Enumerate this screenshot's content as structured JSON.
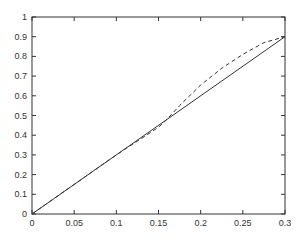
{
  "chart_data": {
    "type": "line",
    "title": "",
    "xlabel": "",
    "ylabel": "",
    "xlim": [
      0,
      0.3
    ],
    "ylim": [
      0,
      1
    ],
    "grid": false,
    "legend": null,
    "x_ticks": [
      "0",
      "0.05",
      "0.1",
      "0.15",
      "0.2",
      "0.25",
      "0.3"
    ],
    "y_ticks": [
      "0",
      "0.1",
      "0.2",
      "0.3",
      "0.4",
      "0.5",
      "0.6",
      "0.7",
      "0.8",
      "0.9",
      "1"
    ],
    "series": [
      {
        "name": "solid",
        "style": "solid",
        "color": "#333333",
        "x": [
          0,
          0.3
        ],
        "y": [
          0,
          0.9
        ]
      },
      {
        "name": "dashed",
        "style": "dashed",
        "color": "#333333",
        "x": [
          0,
          0.05,
          0.1,
          0.125,
          0.15,
          0.16,
          0.175,
          0.2,
          0.225,
          0.25,
          0.275,
          0.3
        ],
        "y": [
          0,
          0.15,
          0.3,
          0.37,
          0.44,
          0.48,
          0.55,
          0.655,
          0.74,
          0.81,
          0.87,
          0.9
        ]
      }
    ]
  },
  "layout": {
    "plot_left": 32,
    "plot_right": 285,
    "plot_top": 17,
    "plot_bottom": 214
  }
}
